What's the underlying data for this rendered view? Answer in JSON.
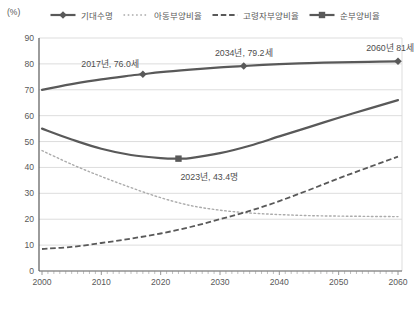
{
  "chart_data": {
    "type": "line",
    "title": "",
    "unit_label": "(%)",
    "xlabel": "",
    "ylabel": "(%)",
    "x_axis": {
      "min": 2000,
      "max": 2060,
      "ticks": [
        2000,
        2010,
        2020,
        2030,
        2040,
        2050,
        2060
      ],
      "minor_tick_step": 1
    },
    "y_axis": {
      "min": 0,
      "max": 90,
      "ticks": [
        0,
        10,
        20,
        30,
        40,
        50,
        60,
        70,
        80,
        90
      ]
    },
    "grid": "horizontal",
    "legend_position": "top",
    "series": [
      {
        "id": "life-expectancy",
        "name": "기대수명",
        "style": "solid",
        "marker": "diamond",
        "color": "#595959",
        "width": 2.2,
        "points": [
          [
            2000,
            70.0
          ],
          [
            2005,
            72.2
          ],
          [
            2010,
            74.0
          ],
          [
            2015,
            75.5
          ],
          [
            2017,
            76.0
          ],
          [
            2020,
            76.8
          ],
          [
            2025,
            77.8
          ],
          [
            2030,
            78.7
          ],
          [
            2034,
            79.2
          ],
          [
            2040,
            79.9
          ],
          [
            2045,
            80.3
          ],
          [
            2050,
            80.6
          ],
          [
            2055,
            80.8
          ],
          [
            2060,
            81.0
          ]
        ],
        "marker_points": [
          [
            2017,
            76.0
          ],
          [
            2034,
            79.2
          ],
          [
            2060,
            81.0
          ]
        ]
      },
      {
        "id": "child-dependency",
        "name": "아동부양비율",
        "style": "dotted",
        "marker": "none",
        "color": "#ababab",
        "width": 1.4,
        "points": [
          [
            2000,
            46.5
          ],
          [
            2005,
            41.2
          ],
          [
            2010,
            36.5
          ],
          [
            2015,
            32.2
          ],
          [
            2020,
            28.3
          ],
          [
            2025,
            25.3
          ],
          [
            2030,
            23.5
          ],
          [
            2035,
            22.4
          ],
          [
            2040,
            21.8
          ],
          [
            2045,
            21.4
          ],
          [
            2050,
            21.2
          ],
          [
            2055,
            21.1
          ],
          [
            2060,
            21.0
          ]
        ],
        "marker_points": []
      },
      {
        "id": "elderly-dependency",
        "name": "고령자부양비율",
        "style": "dashed",
        "marker": "none",
        "color": "#595959",
        "width": 1.8,
        "points": [
          [
            2000,
            8.5
          ],
          [
            2005,
            9.3
          ],
          [
            2010,
            10.8
          ],
          [
            2015,
            12.5
          ],
          [
            2020,
            14.5
          ],
          [
            2025,
            17.0
          ],
          [
            2030,
            20.0
          ],
          [
            2035,
            23.2
          ],
          [
            2040,
            27.0
          ],
          [
            2045,
            31.3
          ],
          [
            2050,
            35.8
          ],
          [
            2055,
            40.0
          ],
          [
            2060,
            44.2
          ]
        ],
        "marker_points": []
      },
      {
        "id": "net-dependency",
        "name": "순부양비율",
        "style": "solid",
        "marker": "square",
        "color": "#595959",
        "width": 2.2,
        "points": [
          [
            2000,
            55.0
          ],
          [
            2005,
            50.8
          ],
          [
            2010,
            47.2
          ],
          [
            2015,
            44.8
          ],
          [
            2020,
            43.6
          ],
          [
            2023,
            43.4
          ],
          [
            2025,
            43.6
          ],
          [
            2030,
            45.5
          ],
          [
            2035,
            48.4
          ],
          [
            2040,
            52.0
          ],
          [
            2045,
            55.6
          ],
          [
            2050,
            59.2
          ],
          [
            2055,
            62.6
          ],
          [
            2060,
            66.0
          ]
        ],
        "marker_points": [
          [
            2023,
            43.4
          ]
        ]
      }
    ],
    "annotations": [
      {
        "text": "2017년, 76.0세",
        "year": 2017,
        "value": 76.0,
        "anchor": "end",
        "dx": -4,
        "dy": -7
      },
      {
        "text": "2034년, 79.2세",
        "year": 2034,
        "value": 79.2,
        "anchor": "middle",
        "dx": 0,
        "dy": -10
      },
      {
        "text": "2060년 81세",
        "year": 2060,
        "value": 81.0,
        "anchor": "end",
        "dx": 16,
        "dy": -10
      },
      {
        "text": "2023년, 43.4명",
        "year": 2023,
        "value": 43.4,
        "anchor": "start",
        "dx": 2,
        "dy": 21
      }
    ],
    "colors": {
      "line_dark": "#595959",
      "line_light": "#ababab",
      "gridline": "#d9d9d9",
      "axis": "#595959",
      "minor_tick": "#8c8c8c",
      "tick_text": "#595959",
      "annotation_text": "#4d4d4d",
      "background": "#ffffff"
    }
  }
}
